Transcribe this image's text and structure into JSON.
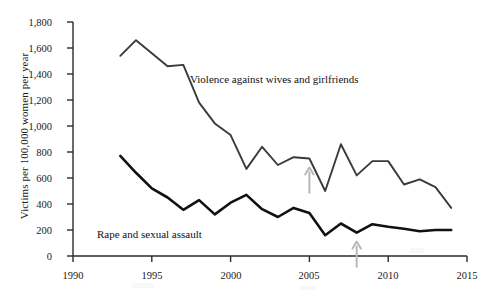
{
  "chart_data": {
    "type": "line",
    "title": "",
    "xlabel": "",
    "ylabel": "Victims per 100,000 women per year",
    "xlim": [
      1990,
      2015
    ],
    "ylim": [
      0,
      1800
    ],
    "grid": false,
    "legend_position": "inline-annotation",
    "xticks": [
      "1990",
      "1995",
      "2000",
      "2005",
      "2010",
      "2015"
    ],
    "xtick_values": [
      1990,
      1995,
      2000,
      2005,
      2010,
      2015
    ],
    "yticks": [
      "0",
      "200",
      "400",
      "600",
      "800",
      "1,000",
      "1,200",
      "1,400",
      "1,600",
      "1,800"
    ],
    "ytick_values": [
      0,
      200,
      400,
      600,
      800,
      1000,
      1200,
      1400,
      1600,
      1800
    ],
    "x": [
      1993,
      1994,
      1995,
      1996,
      1997,
      1998,
      1999,
      2000,
      2001,
      2002,
      2003,
      2004,
      2005,
      2006,
      2007,
      2008,
      2009,
      2010,
      2011,
      2012,
      2013,
      2014
    ],
    "series": [
      {
        "name": "Violence against wives and girlfriends",
        "color": "#3a3a3a",
        "values": [
          1540,
          1660,
          1560,
          1460,
          1470,
          1180,
          1020,
          930,
          670,
          840,
          700,
          760,
          750,
          500,
          860,
          620,
          730,
          730,
          550,
          590,
          530,
          370
        ]
      },
      {
        "name": "Rape and sexual assault",
        "color": "#111111",
        "values": [
          770,
          640,
          520,
          450,
          355,
          430,
          320,
          410,
          470,
          360,
          300,
          370,
          330,
          160,
          250,
          180,
          245,
          225,
          210,
          190,
          200,
          200
        ]
      }
    ],
    "annotations": [
      {
        "name": "arrow-2005",
        "x": 2005,
        "points_to": "Violence against wives and girlfriends",
        "color": "#b8b8b8"
      },
      {
        "name": "arrow-2008",
        "x": 2008,
        "points_to": "Rape and sexual assault",
        "color": "#b8b8b8"
      }
    ],
    "inline_labels": [
      {
        "text": "Violence against wives and girlfriends",
        "x": 2002,
        "y": 1310
      },
      {
        "text": "Rape and sexual assault",
        "x": 1996.2,
        "y": 205
      }
    ]
  }
}
